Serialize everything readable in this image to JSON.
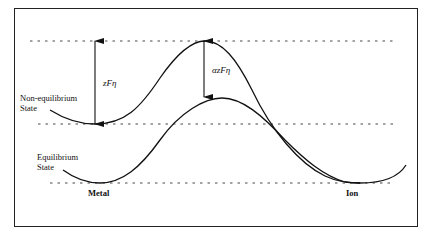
{
  "figure": {
    "labels": {
      "non_equilibrium_line1": "Non-equilibrium",
      "non_equilibrium_line2": "State",
      "equilibrium_line1": "Equilibrium",
      "equilibrium_line2": "State",
      "metal": "Metal",
      "ion": "Ion"
    },
    "annotations": {
      "overpotential_energy": "zFη",
      "barrier_change": "αzFη"
    }
  }
}
